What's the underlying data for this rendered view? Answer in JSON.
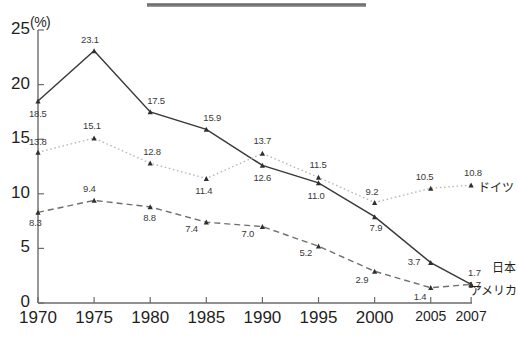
{
  "chart_data": {
    "type": "line",
    "title": "",
    "subtitle": "",
    "xlabel": "",
    "ylabel": "(%)",
    "unit_label": "(%)",
    "x": [
      1970,
      1975,
      1980,
      1985,
      1990,
      1995,
      2000,
      2005,
      2007
    ],
    "xticklabels": [
      "1970",
      "1975",
      "1980",
      "1985",
      "1990",
      "1995",
      "2000",
      "2005",
      "2007"
    ],
    "yticklabels": [
      "0",
      "5",
      "10",
      "15",
      "20",
      "25"
    ],
    "yticks": [
      0,
      5,
      10,
      15,
      20,
      25
    ],
    "xlim": [
      1970,
      2007
    ],
    "ylim": [
      0,
      25
    ],
    "grid": false,
    "legend_position": "right-inline",
    "series": [
      {
        "name": "日本",
        "style": "solid",
        "marker": "triangle",
        "color": "#3a3a3a",
        "x": [
          1970,
          1975,
          1980,
          1985,
          1990,
          1995,
          2000,
          2005,
          2007
        ],
        "values": [
          18.5,
          23.1,
          17.5,
          15.9,
          12.6,
          11.0,
          7.9,
          3.7,
          1.7
        ],
        "labels": [
          "18.5",
          "23.1",
          "17.5",
          "15.9",
          "12.6",
          "11.0",
          "7.9",
          "3.7",
          "1.7"
        ]
      },
      {
        "name": "ドイツ",
        "style": "dotted",
        "marker": "triangle",
        "color": "#b9b9b9",
        "x": [
          1970,
          1975,
          1980,
          1985,
          1990,
          1995,
          2000,
          2005,
          2007
        ],
        "values": [
          13.8,
          15.1,
          12.8,
          11.4,
          13.7,
          11.5,
          9.2,
          10.5,
          10.8
        ],
        "labels": [
          "13.8",
          "15.1",
          "12.8",
          "11.4",
          "13.7",
          "11.5",
          "9.2",
          "10.5",
          "10.8"
        ]
      },
      {
        "name": "アメリカ",
        "style": "dashed",
        "marker": "triangle",
        "color": "#6f6f6f",
        "x": [
          1970,
          1975,
          1980,
          1985,
          1990,
          1995,
          2000,
          2005,
          2007
        ],
        "values": [
          8.3,
          9.4,
          8.8,
          7.4,
          7.0,
          5.2,
          2.9,
          1.4,
          1.7
        ],
        "labels": [
          "8.3",
          "9.4",
          "8.8",
          "7.4",
          "7.0",
          "5.2",
          "2.9",
          "1.4",
          "1.7"
        ]
      }
    ],
    "annotations": []
  },
  "axis": {
    "unit": "(%)",
    "y_ticks": [
      "25",
      "20",
      "15",
      "10",
      "5",
      "0"
    ],
    "x_ticks": [
      "1970",
      "1975",
      "1980",
      "1985",
      "1990",
      "1995",
      "2000",
      "2005",
      "2007"
    ]
  },
  "series_labels": {
    "germany": "ドイツ",
    "japan": "日本",
    "america": "アメリカ"
  },
  "data_labels": {
    "japan": [
      "18.5",
      "23.1",
      "17.5",
      "15.9",
      "12.6",
      "11.0",
      "7.9",
      "3.7",
      "1.7"
    ],
    "germany": [
      "13.8",
      "15.1",
      "12.8",
      "11.4",
      "13.7",
      "11.5",
      "9.2",
      "10.5",
      "10.8"
    ],
    "america": [
      "8.3",
      "9.4",
      "8.8",
      "7.4",
      "7.0",
      "5.2",
      "2.9",
      "1.4",
      "1.7"
    ]
  },
  "footnote": ""
}
